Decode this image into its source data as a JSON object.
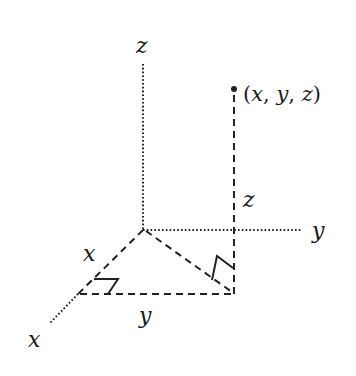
{
  "diagram": {
    "axes": {
      "z": {
        "label": "z"
      },
      "y": {
        "label": "y"
      },
      "x": {
        "label": "x"
      }
    },
    "point": {
      "label_open": "(",
      "x": "x",
      "comma1": ", ",
      "y": "y",
      "comma2": ", ",
      "z": "z",
      "label_close": ")"
    },
    "segments": {
      "x_length_label": "x",
      "y_length_label": "y",
      "z_height_label": "z"
    },
    "colors": {
      "stroke": "#222222",
      "text": "#1a1a1a",
      "background": "#ffffff"
    }
  }
}
